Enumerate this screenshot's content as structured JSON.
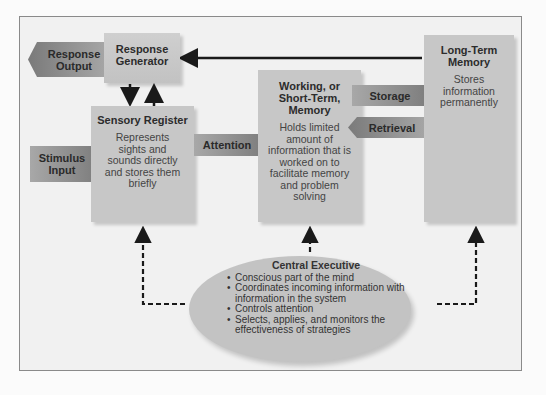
{
  "diagram": {
    "type": "information-processing model",
    "nodes": {
      "response_output": {
        "label": "Response Output"
      },
      "response_generator": {
        "label": "Response Generator"
      },
      "stimulus_input": {
        "label": "Stimulus Input"
      },
      "sensory_register": {
        "title": "Sensory Register",
        "description": "Represents sights and sounds directly and stores them briefly"
      },
      "attention": {
        "label": "Attention"
      },
      "working_memory": {
        "title": "Working, or Short-Term, Memory",
        "description": "Holds limited amount of information that is worked on to facilitate memory and problem solving"
      },
      "storage": {
        "label": "Storage"
      },
      "retrieval": {
        "label": "Retrieval"
      },
      "long_term_memory": {
        "title": "Long-Term Memory",
        "description": "Stores information permanently"
      },
      "central_executive": {
        "title": "Central Executive",
        "bullets": [
          "Conscious part of the mind",
          "Coordinates incoming information with information in the system",
          "Controls attention",
          "Selects, applies, and monitors the effectiveness of strategies"
        ]
      }
    },
    "edges": [
      {
        "from": "long_term_memory",
        "to": "response_generator",
        "style": "solid"
      },
      {
        "from": "response_generator",
        "to": "sensory_register",
        "style": "solid"
      },
      {
        "from": "sensory_register",
        "to": "response_generator",
        "style": "solid"
      },
      {
        "from": "response_generator",
        "to": "response_output",
        "style": "arrow-shape"
      },
      {
        "from": "stimulus_input",
        "to": "sensory_register",
        "style": "arrow-shape"
      },
      {
        "from": "sensory_register",
        "to": "working_memory",
        "label": "Attention",
        "style": "arrow-shape"
      },
      {
        "from": "working_memory",
        "to": "long_term_memory",
        "label": "Storage",
        "style": "arrow-shape"
      },
      {
        "from": "long_term_memory",
        "to": "working_memory",
        "label": "Retrieval",
        "style": "arrow-shape"
      },
      {
        "from": "central_executive",
        "to": "sensory_register",
        "style": "dashed"
      },
      {
        "from": "central_executive",
        "to": "working_memory",
        "style": "dashed"
      },
      {
        "from": "central_executive",
        "to": "long_term_memory",
        "style": "dashed"
      }
    ],
    "colors": {
      "box_fill": "#c7c7c7",
      "arrow_fill": "#8c8c8c",
      "line": "#1a1a1a",
      "background": "#f1f1f1"
    }
  }
}
